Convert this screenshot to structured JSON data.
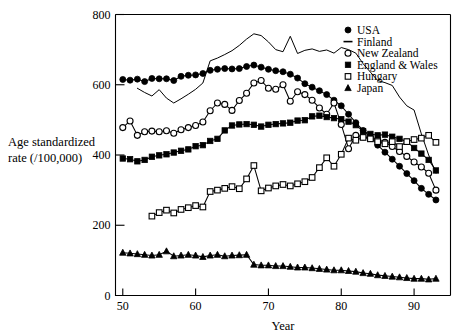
{
  "figure": {
    "name": "age-standardized-mortality-rate-by-country-line-chart",
    "background": "#ffffff",
    "ink_color": "#000000"
  },
  "axes": {
    "x_title": "Year",
    "y_title_line1": "Age standardized",
    "y_title_line2": "rate (/100,000)",
    "x_ticks": [
      "50",
      "60",
      "70",
      "80",
      "90"
    ],
    "x_tick_values": [
      50,
      60,
      70,
      80,
      90
    ],
    "y_ticks": [
      "0",
      "200",
      "400",
      "600",
      "800"
    ],
    "y_tick_values": [
      0,
      200,
      400,
      600,
      800
    ],
    "xlim": [
      49,
      95
    ],
    "ylim": [
      0,
      800
    ],
    "grid": false
  },
  "legend": {
    "position": "top-right-inside",
    "entries": [
      {
        "label": "USA",
        "marker": "filled-circle"
      },
      {
        "label": "Finland",
        "marker": "line-dash"
      },
      {
        "label": "New Zealand",
        "marker": "open-circle"
      },
      {
        "label": "England & Wales",
        "marker": "filled-square"
      },
      {
        "label": "Hungary",
        "marker": "open-square"
      },
      {
        "label": "Japan",
        "marker": "filled-triangle"
      }
    ]
  },
  "chart_data": {
    "type": "line",
    "title": "",
    "xlabel": "Year",
    "ylabel": "Age standardized rate (/100,000)",
    "xlim": [
      49,
      95
    ],
    "ylim": [
      0,
      800
    ],
    "grid": false,
    "legend_position": "top-right-inside",
    "series": [
      {
        "name": "USA",
        "marker": "filled-circle",
        "x": [
          50,
          51,
          52,
          53,
          54,
          55,
          56,
          57,
          58,
          59,
          60,
          61,
          62,
          63,
          64,
          65,
          66,
          67,
          68,
          69,
          70,
          71,
          72,
          73,
          74,
          75,
          76,
          77,
          78,
          79,
          80,
          81,
          82,
          83,
          84,
          85,
          86,
          87,
          88,
          89,
          90,
          91,
          92,
          93
        ],
        "values": [
          615,
          613,
          616,
          609,
          618,
          617,
          617,
          612,
          624,
          627,
          628,
          632,
          641,
          644,
          646,
          645,
          646,
          652,
          656,
          650,
          644,
          640,
          637,
          630,
          619,
          603,
          593,
          583,
          572,
          556,
          540,
          516,
          492,
          470,
          450,
          428,
          408,
          388,
          368,
          347,
          327,
          305,
          288,
          272
        ]
      },
      {
        "name": "Finland",
        "marker": "line",
        "x": [
          52,
          53,
          54,
          55,
          56,
          57,
          58,
          59,
          60,
          61,
          62,
          63,
          64,
          65,
          66,
          67,
          68,
          69,
          70,
          71,
          72,
          73,
          74,
          75,
          76,
          77,
          78,
          79,
          80,
          81,
          82,
          83,
          84,
          85,
          86,
          87,
          88,
          89,
          90,
          91,
          92,
          93
        ],
        "values": [
          590,
          578,
          568,
          586,
          562,
          548,
          560,
          573,
          587,
          605,
          668,
          676,
          686,
          697,
          712,
          730,
          745,
          740,
          722,
          700,
          694,
          738,
          689,
          698,
          702,
          695,
          699,
          690,
          706,
          700,
          690,
          660,
          636,
          612,
          606,
          598,
          565,
          540,
          528,
          460,
          400,
          348
        ]
      },
      {
        "name": "New Zealand",
        "marker": "open-circle",
        "x": [
          50,
          51,
          52,
          53,
          54,
          55,
          56,
          57,
          58,
          59,
          60,
          61,
          62,
          63,
          64,
          65,
          66,
          67,
          68,
          69,
          70,
          71,
          72,
          73,
          74,
          75,
          76,
          77,
          78,
          79,
          80,
          81,
          82,
          83,
          84,
          85,
          86,
          87,
          88,
          89,
          90,
          91,
          92,
          93
        ],
        "values": [
          478,
          497,
          456,
          466,
          468,
          466,
          469,
          462,
          472,
          478,
          484,
          494,
          526,
          548,
          544,
          527,
          555,
          576,
          605,
          612,
          590,
          587,
          600,
          553,
          580,
          572,
          556,
          534,
          516,
          548,
          487,
          418,
          456,
          452,
          448,
          444,
          436,
          424,
          410,
          396,
          380,
          366,
          348,
          300
        ]
      },
      {
        "name": "England & Wales",
        "marker": "filled-square",
        "x": [
          50,
          51,
          52,
          53,
          54,
          55,
          56,
          57,
          58,
          59,
          60,
          61,
          62,
          63,
          64,
          65,
          66,
          67,
          68,
          69,
          70,
          71,
          72,
          73,
          74,
          75,
          76,
          77,
          78,
          79,
          80,
          81,
          82,
          83,
          84,
          85,
          86,
          87,
          88,
          89,
          90,
          91,
          92,
          93
        ],
        "values": [
          390,
          388,
          382,
          386,
          395,
          399,
          402,
          407,
          412,
          416,
          425,
          428,
          440,
          446,
          470,
          484,
          487,
          488,
          486,
          481,
          486,
          488,
          490,
          492,
          498,
          499,
          510,
          512,
          508,
          505,
          502,
          495,
          485,
          468,
          460,
          456,
          458,
          452,
          446,
          438,
          420,
          404,
          386,
          356
        ]
      },
      {
        "name": "Hungary",
        "marker": "open-square",
        "x": [
          54,
          55,
          56,
          57,
          58,
          59,
          60,
          61,
          62,
          63,
          64,
          65,
          66,
          67,
          68,
          69,
          70,
          71,
          72,
          73,
          74,
          75,
          76,
          77,
          78,
          79,
          80,
          81,
          82,
          83,
          84,
          85,
          86,
          87,
          88,
          89,
          90,
          91,
          92,
          93
        ],
        "values": [
          226,
          236,
          243,
          235,
          245,
          250,
          256,
          252,
          296,
          300,
          305,
          310,
          304,
          332,
          370,
          298,
          306,
          312,
          316,
          312,
          318,
          324,
          336,
          364,
          392,
          368,
          402,
          448,
          442,
          450,
          446,
          438,
          432,
          438,
          424,
          438,
          444,
          448,
          456,
          436
        ]
      },
      {
        "name": "Japan",
        "marker": "filled-triangle",
        "x": [
          50,
          51,
          52,
          53,
          54,
          55,
          56,
          57,
          58,
          59,
          60,
          61,
          62,
          63,
          64,
          65,
          66,
          67,
          68,
          69,
          70,
          71,
          72,
          73,
          74,
          75,
          76,
          77,
          78,
          79,
          80,
          81,
          82,
          83,
          84,
          85,
          86,
          87,
          88,
          89,
          90,
          91,
          92,
          93
        ],
        "values": [
          122,
          120,
          118,
          116,
          114,
          116,
          126,
          112,
          114,
          116,
          114,
          110,
          114,
          116,
          112,
          114,
          115,
          116,
          88,
          86,
          86,
          84,
          84,
          82,
          80,
          80,
          78,
          76,
          74,
          72,
          72,
          70,
          68,
          64,
          62,
          58,
          56,
          54,
          52,
          50,
          48,
          48,
          46,
          48
        ]
      }
    ]
  }
}
